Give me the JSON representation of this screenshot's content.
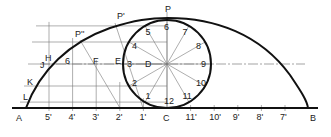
{
  "diagram": {
    "baseline_labels": {
      "left_end": "A",
      "right_end": "B",
      "center": "C"
    },
    "left_divisions": [
      "5'",
      "4'",
      "3'",
      "2'",
      "1'"
    ],
    "right_divisions": [
      "11'",
      "10'",
      "9'",
      "8'",
      "7'"
    ],
    "circle_points": [
      "1",
      "2",
      "3",
      "4",
      "5",
      "6",
      "7",
      "8",
      "9",
      "10",
      "11",
      "12"
    ],
    "circle_center_label": "D",
    "top_point_label": "P",
    "curve_points": [
      "P'",
      "P''"
    ],
    "centerline_labels": [
      "6",
      "F",
      "E"
    ],
    "arc_labels": [
      "H",
      "J",
      "K",
      "L"
    ]
  }
}
